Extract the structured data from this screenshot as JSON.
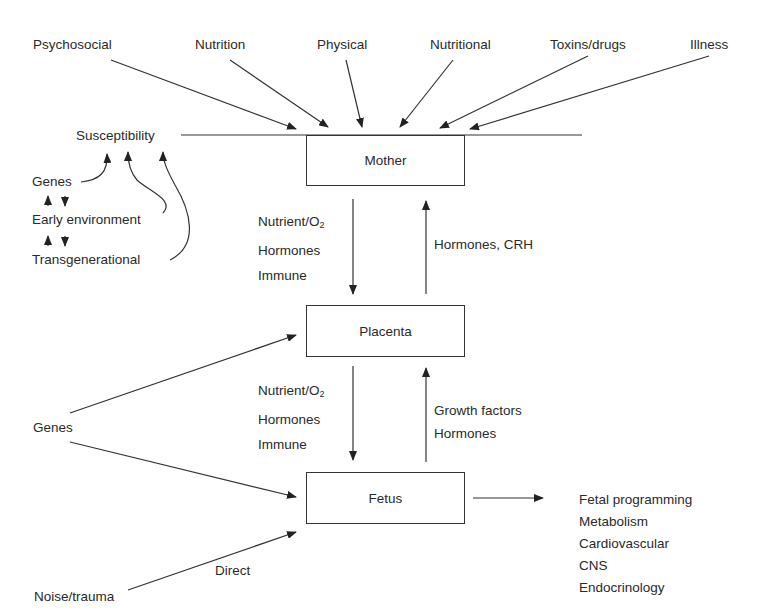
{
  "diagram": {
    "top_influences": [
      "Psychosocial",
      "Nutrition",
      "Physical",
      "Nutritional",
      "Toxins/drugs",
      "Illness"
    ],
    "susceptibility": {
      "label": "Susceptibility",
      "sources": [
        "Genes",
        "Early environment",
        "Transgenerational"
      ]
    },
    "nodes": {
      "mother": "Mother",
      "placenta": "Placenta",
      "fetus": "Fetus"
    },
    "mother_to_placenta": {
      "line1_prefix": "Nutrient/O",
      "line1_sub": "2",
      "line2": "Hormones",
      "line3": "Immune"
    },
    "placenta_to_mother": "Hormones, CRH",
    "placenta_to_fetus": {
      "line1_prefix": "Nutrient/O",
      "line1_sub": "2",
      "line2": "Hormones",
      "line3": "Immune"
    },
    "fetus_to_placenta": {
      "line1": "Growth factors",
      "line2": "Hormones"
    },
    "genes_label": "Genes",
    "noise_label": "Noise/trauma",
    "direct_label": "Direct",
    "outcomes": {
      "title": "Fetal programming",
      "items": [
        "Metabolism",
        "Cardiovascular",
        "CNS",
        "Endocrinology"
      ]
    }
  }
}
